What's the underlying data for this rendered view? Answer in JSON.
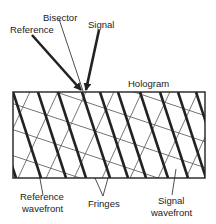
{
  "diagram": {
    "labels": {
      "reference": "Reference",
      "bisector": "Bisector",
      "signal": "Signal",
      "hologram": "Hologram",
      "reference_wavefront_line1": "Reference",
      "reference_wavefront_line2": "wavefront",
      "fringes": "Fringes",
      "signal_wavefront_line1": "Signal",
      "signal_wavefront_line2": "wavefront"
    },
    "colors": {
      "ink": "#222222",
      "light_lines": "#777777",
      "background": "#ffffff"
    }
  }
}
